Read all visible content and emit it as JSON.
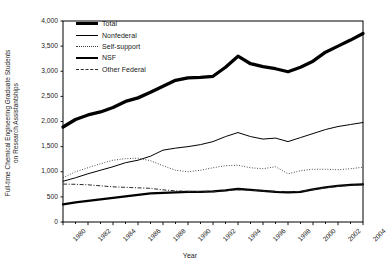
{
  "chart_data": {
    "type": "line",
    "title": "",
    "xlabel": "Year",
    "ylabel": "Full-time Chemical Engineering Graduate Students on Research Assistantships",
    "ylabel_line1": "Full-time Chemical Engineering Graduate Students",
    "ylabel_line2": "on Research Assistantships",
    "xlim": [
      1980,
      2004
    ],
    "ylim": [
      0,
      4000
    ],
    "ytick_labels": [
      "0",
      "500",
      "1,000",
      "1,500",
      "2,000",
      "2,500",
      "3,000",
      "3,500",
      "4,000"
    ],
    "ytick_values": [
      0,
      500,
      1000,
      1500,
      2000,
      2500,
      3000,
      3500,
      4000
    ],
    "xtick_labels": [
      "1980",
      "1982",
      "1984",
      "1986",
      "1988",
      "1990",
      "1992",
      "1994",
      "1996",
      "1998",
      "2000",
      "2002",
      "2004"
    ],
    "xtick_values": [
      1980,
      1982,
      1984,
      1986,
      1988,
      1990,
      1992,
      1994,
      1996,
      1998,
      2000,
      2002,
      2004
    ],
    "x": [
      1980,
      1981,
      1982,
      1983,
      1984,
      1985,
      1986,
      1987,
      1988,
      1989,
      1990,
      1991,
      1992,
      1993,
      1994,
      1995,
      1996,
      1997,
      1998,
      1999,
      2000,
      2001,
      2002,
      2003,
      2004
    ],
    "grid": false,
    "legend_position": "top-left",
    "series": [
      {
        "name": "Total",
        "style": "thick-solid",
        "color": "#000000",
        "linewidth": 3.3,
        "values": [
          1890,
          2040,
          2130,
          2190,
          2280,
          2400,
          2470,
          2580,
          2700,
          2820,
          2870,
          2880,
          2900,
          3080,
          3300,
          3150,
          3090,
          3050,
          2990,
          3080,
          3200,
          3380,
          3500,
          3620,
          3750
        ]
      },
      {
        "name": "Nonfederal",
        "style": "thin-solid",
        "color": "#000000",
        "linewidth": 1.0,
        "values": [
          810,
          880,
          960,
          1030,
          1100,
          1180,
          1230,
          1310,
          1430,
          1470,
          1500,
          1540,
          1600,
          1700,
          1780,
          1700,
          1650,
          1670,
          1600,
          1680,
          1760,
          1840,
          1900,
          1940,
          1980
        ]
      },
      {
        "name": "Self-support",
        "style": "dotted",
        "color": "#3a3a3a",
        "linewidth": 1.0,
        "values": [
          880,
          1000,
          1080,
          1160,
          1230,
          1260,
          1270,
          1220,
          1120,
          1030,
          1000,
          1030,
          1080,
          1120,
          1130,
          1080,
          1060,
          1100,
          960,
          1020,
          1050,
          1050,
          1040,
          1060,
          1090
        ]
      },
      {
        "name": "NSF",
        "style": "medium-solid",
        "color": "#000000",
        "linewidth": 2.2,
        "values": [
          350,
          390,
          420,
          450,
          480,
          510,
          540,
          570,
          580,
          590,
          600,
          600,
          610,
          630,
          660,
          640,
          620,
          600,
          590,
          600,
          650,
          690,
          720,
          740,
          750
        ]
      },
      {
        "name": "Other Federal",
        "style": "dash-dot",
        "color": "#2b2b2b",
        "linewidth": 1.0,
        "values": [
          755,
          750,
          740,
          720,
          700,
          690,
          680,
          670,
          640,
          620,
          610,
          600,
          600,
          620,
          640,
          630,
          620,
          610,
          600,
          610,
          640,
          680,
          710,
          730,
          740
        ]
      }
    ]
  },
  "legend": {
    "items": [
      {
        "label": "Total",
        "key_class": "k-total"
      },
      {
        "label": "Nonfederal",
        "key_class": "k-nonfed"
      },
      {
        "label": "Self-support",
        "key_class": "k-self"
      },
      {
        "label": "NSF",
        "key_class": "k-nsf"
      },
      {
        "label": "Other Federal",
        "key_class": "k-other"
      }
    ]
  },
  "axis": {
    "frame_color": "#000000"
  }
}
